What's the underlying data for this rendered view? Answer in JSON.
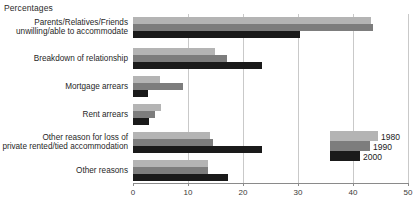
{
  "chart_data": {
    "type": "bar",
    "orientation": "horizontal",
    "title": "Percentages",
    "xlabel": "",
    "ylabel": "",
    "xlim": [
      0,
      50
    ],
    "xticks": [
      0,
      10,
      20,
      30,
      40,
      50
    ],
    "xtick_labels": [
      "0",
      "10",
      "20",
      "30",
      "40",
      "50"
    ],
    "grid": true,
    "legend_position": "inside-right",
    "categories": [
      "Parents/Relatives/Friends\nunwilling/able to accommodate",
      "Breakdown of relationship",
      "Mortgage arrears",
      "Rent arrears",
      "Other reason for loss of\nprivate rented/tied accommodation",
      "Other reasons"
    ],
    "series": [
      {
        "name": "1980",
        "color": "#b4b4b4",
        "values": [
          43.2,
          14.9,
          4.9,
          5.1,
          14.0,
          13.6
        ]
      },
      {
        "name": "1990",
        "color": "#7d7d7d",
        "values": [
          43.6,
          17.1,
          9.1,
          4.0,
          14.5,
          13.6
        ]
      },
      {
        "name": "2000",
        "color": "#1a1a1a",
        "values": [
          30.4,
          23.5,
          2.7,
          2.9,
          23.5,
          17.3
        ]
      }
    ]
  },
  "legend": {
    "items": [
      {
        "label": "1980",
        "color": "#b4b4b4"
      },
      {
        "label": "1990",
        "color": "#7d7d7d"
      },
      {
        "label": "2000",
        "color": "#1a1a1a"
      }
    ]
  },
  "axis": {
    "baseline_color": "#8a8a8a",
    "grid_color": "#c9c9c9"
  }
}
